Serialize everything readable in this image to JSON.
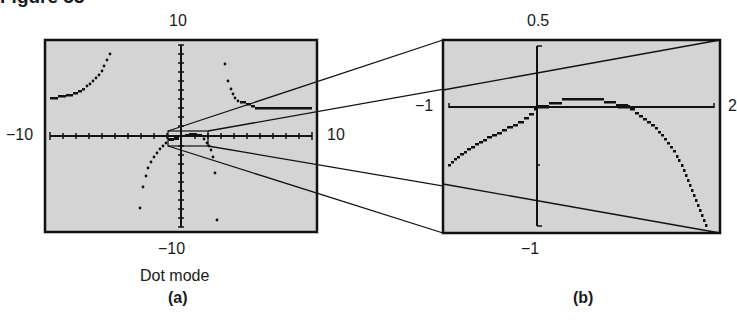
{
  "figure": {
    "title": "Figure 53"
  },
  "panel_a": {
    "caption": "(a)",
    "mode_label": "Dot mode",
    "ymax_label": "10",
    "ymin_label": "−10",
    "xmin_label": "−10",
    "xmax_label": "10",
    "window": {
      "xmin": -10,
      "xmax": 10,
      "ymin": -10,
      "ymax": 10
    }
  },
  "panel_b": {
    "caption": "(b)",
    "ymax_label": "0.5",
    "ymin_label": "−1",
    "xmin_label": "−1",
    "xmax_label": "2",
    "window": {
      "xmin": -1,
      "xmax": 2,
      "ymin": -1,
      "ymax": 0.5
    }
  },
  "colors": {
    "screen_bg": "#d4d4d4",
    "ink": "#111111",
    "page_bg": "#ffffff"
  }
}
